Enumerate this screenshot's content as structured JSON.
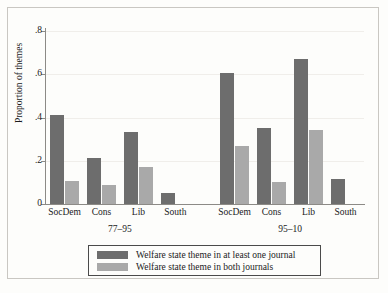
{
  "chart_data": {
    "type": "bar",
    "title": "",
    "xlabel": "",
    "ylabel": "Proportion of themes",
    "ylim": [
      0,
      0.8
    ],
    "yticks": [
      0,
      0.2,
      0.4,
      0.6,
      0.8
    ],
    "ytick_labels": [
      "0",
      ".2",
      ".4",
      ".6",
      ".8"
    ],
    "grid": true,
    "legend_position": "bottom",
    "groups": [
      {
        "label": "77–95",
        "categories": [
          "SocDem",
          "Cons",
          "Lib",
          "South"
        ]
      },
      {
        "label": "95–10",
        "categories": [
          "SocDem",
          "Cons",
          "Lib",
          "South"
        ]
      }
    ],
    "categories": [
      "SocDem",
      "Cons",
      "Lib",
      "South",
      "SocDem",
      "Cons",
      "Lib",
      "South"
    ],
    "series": [
      {
        "name": "Welfare state theme in at least one journal",
        "color": "#6d6d6d",
        "values": [
          0.41,
          0.215,
          0.335,
          0.05,
          0.605,
          0.35,
          0.67,
          0.115
        ]
      },
      {
        "name": "Welfare state theme in both journals",
        "color": "#a9a9a9",
        "values": [
          0.105,
          0.09,
          0.17,
          0.0,
          0.27,
          0.1,
          0.34,
          0.0
        ]
      }
    ]
  },
  "legend": {
    "items": [
      {
        "label": "Welfare state theme in at least one journal",
        "color": "#6d6d6d"
      },
      {
        "label": "Welfare state theme in both journals",
        "color": "#a9a9a9"
      }
    ]
  }
}
